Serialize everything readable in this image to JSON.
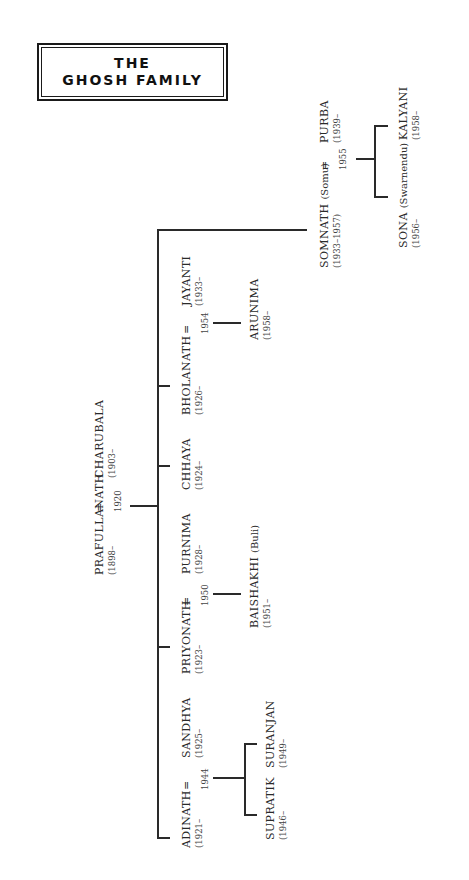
{
  "title": {
    "line1": "THE",
    "line2": "GHOSH FAMILY"
  },
  "marriage_symbol": "=",
  "people": {
    "prafullanath": {
      "name": "PRAFULLANATH",
      "years": "(1898–"
    },
    "charubala": {
      "name": "CHARUBALA",
      "years": "(1903–"
    },
    "adinath": {
      "name": "ADINATH",
      "years": "(1921–"
    },
    "sandhya": {
      "name": "SANDHYA",
      "years": "(1925–"
    },
    "priyonath": {
      "name": "PRIYONATH",
      "years": "(1923–"
    },
    "purnima": {
      "name": "PURNIMA",
      "years": "(1928–"
    },
    "chhaya": {
      "name": "CHHAYA",
      "years": "(1924–"
    },
    "bholanath": {
      "name": "BHOLANATH",
      "years": "(1926–"
    },
    "jayanti": {
      "name": "JAYANTI",
      "years": "(1933–"
    },
    "somnath": {
      "name": "SOMNATH",
      "alias": "(Somu)",
      "years": "(1933–1957)"
    },
    "purba": {
      "name": "PURBA",
      "years": "(1939–"
    },
    "supratik": {
      "name": "SUPRATIK",
      "years": "(1946–"
    },
    "suranjan": {
      "name": "SURANJAN",
      "years": "(1949–"
    },
    "baishakhi": {
      "name": "BAISHAKHI",
      "alias": "(Buli)",
      "years": "(1951–"
    },
    "arunima": {
      "name": "ARUNIMA",
      "years": "(1958–"
    },
    "sona": {
      "name": "SONA",
      "alias": "(Swarnendu)",
      "years": "(1956–"
    },
    "kalyani": {
      "name": "KALYANI",
      "years": "(1958–"
    }
  },
  "marriages": {
    "prafullanath_charubala": "1920",
    "adinath_sandhya": "1944",
    "priyonath_purnima": "1950",
    "bholanath_jayanti": "1954",
    "somnath_purba": "1955"
  }
}
